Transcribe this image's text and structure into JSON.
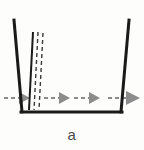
{
  "figure": {
    "caption": "a",
    "colors": {
      "container_stroke": "#1a1a1a",
      "solid_interface_stroke": "#1a1a1a",
      "dashed_interface_stroke": "#3a3a3a",
      "arrow_fill": "#8c8c8c",
      "arrow_tail": "#8c8c8c",
      "background": "#fdfdfc"
    },
    "container": {
      "name": "open-top-vessel",
      "left_wall": {
        "x_top": 14,
        "y_top": 20,
        "x_bottom": 22,
        "y_bottom": 112
      },
      "right_wall": {
        "x_top": 129,
        "y_top": 20,
        "x_bottom": 121,
        "y_bottom": 112
      },
      "bottom": {
        "x_start": 22,
        "x_end": 121,
        "y": 112
      },
      "stroke_width": 3
    },
    "interfaces": [
      {
        "name": "solid-front",
        "style": "solid",
        "x_top": 33,
        "y_top": 32,
        "x_bottom": 29,
        "y_bottom": 110,
        "width": 2
      },
      {
        "name": "dashed-front-inner",
        "style": "dashed",
        "x_top": 38,
        "y_top": 32,
        "x_bottom": 34,
        "y_bottom": 110,
        "width": 1.4
      },
      {
        "name": "dashed-front-outer",
        "style": "dashed",
        "x_top": 43,
        "y_top": 33,
        "x_bottom": 39,
        "y_bottom": 110,
        "width": 1.4
      }
    ],
    "flow_arrows": [
      {
        "name": "flow-arrow-1",
        "tail_x": 4,
        "tip_x": 30,
        "y": 98
      },
      {
        "name": "flow-arrow-2",
        "tail_x": 44,
        "tip_x": 70,
        "y": 98
      },
      {
        "name": "flow-arrow-3",
        "tail_x": 74,
        "tip_x": 100,
        "y": 98
      },
      {
        "name": "flow-arrow-4",
        "tail_x": 108,
        "tip_x": 138,
        "y": 98
      }
    ],
    "arrow_geometry": {
      "head_length": 11,
      "head_half_height": 6,
      "tail_dash": "4 3",
      "tail_width": 2
    }
  }
}
